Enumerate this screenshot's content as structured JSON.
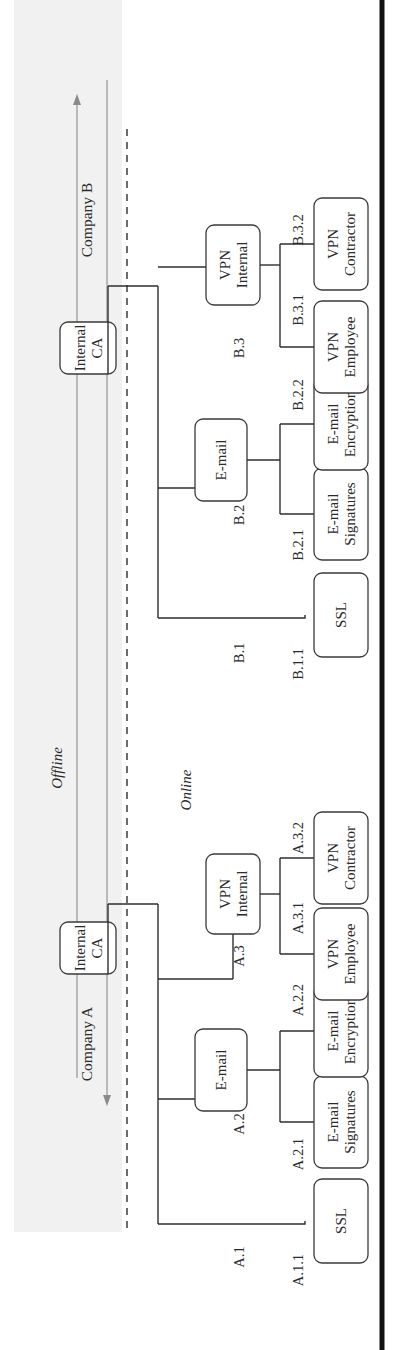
{
  "figure": {
    "orientation": "rotated-90-ccw",
    "zones": {
      "offline": "Offline",
      "online": "Online"
    },
    "colors": {
      "line": "#2e2e2e",
      "box_border": "#3a3a3a",
      "offline_arrows": "#8a8a8a",
      "offline_shading": "#f1f1f1",
      "frame": "#111111"
    },
    "company_a": {
      "name": "Company A",
      "root": {
        "line1": "Internal",
        "line2": "CA"
      },
      "branches": [
        {
          "id": "A.1",
          "leaves": [
            {
              "id": "A.1.1",
              "line1": "SSL",
              "line2": ""
            }
          ]
        },
        {
          "id": "A.2",
          "node": {
            "line1": "E-mail",
            "line2": ""
          },
          "leaves": [
            {
              "id": "A.2.1",
              "line1": "E-mail",
              "line2": "Signatures"
            },
            {
              "id": "A.2.2",
              "line1": "E-mail",
              "line2": "Encryption"
            }
          ]
        },
        {
          "id": "A.3",
          "node": {
            "line1": "VPN",
            "line2": "Internal"
          },
          "leaves": [
            {
              "id": "A.3.1",
              "line1": "VPN",
              "line2": "Employee"
            },
            {
              "id": "A.3.2",
              "line1": "VPN",
              "line2": "Contractor"
            }
          ]
        }
      ]
    },
    "company_b": {
      "name": "Company B",
      "root": {
        "line1": "Internal",
        "line2": "CA"
      },
      "branches": [
        {
          "id": "B.1",
          "leaves": [
            {
              "id": "B.1.1",
              "line1": "SSL",
              "line2": ""
            }
          ]
        },
        {
          "id": "B.2",
          "node": {
            "line1": "E-mail",
            "line2": ""
          },
          "leaves": [
            {
              "id": "B.2.1",
              "line1": "E-mail",
              "line2": "Signatures"
            },
            {
              "id": "B.2.2",
              "line1": "E-mail",
              "line2": "Encryption"
            }
          ]
        },
        {
          "id": "B.3",
          "node": {
            "line1": "VPN",
            "line2": "Internal"
          },
          "leaves": [
            {
              "id": "B.3.1",
              "line1": "VPN",
              "line2": "Employee"
            },
            {
              "id": "B.3.2",
              "line1": "VPN",
              "line2": "Contractor"
            }
          ]
        }
      ]
    }
  }
}
